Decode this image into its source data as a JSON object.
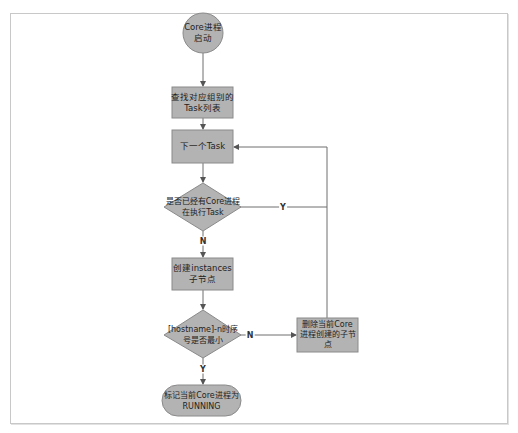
{
  "diagram": {
    "type": "flowchart",
    "colors": {
      "node_fill": "#b3b3b3",
      "node_stroke": "#8a8a8a",
      "edge": "#6f6f6f",
      "frame": "#c8c8c8"
    },
    "nodes": {
      "start": {
        "shape": "circle",
        "label": "Core进程\n启动"
      },
      "find_tasks": {
        "shape": "rect",
        "label": "查找对应组别的\nTask列表"
      },
      "next_task": {
        "shape": "rect",
        "label": "下一个Task"
      },
      "check_running": {
        "shape": "diamond",
        "label": "是否已经有Core进程\n在执行Task"
      },
      "create_instances": {
        "shape": "rect",
        "label": "创建instances\n子节点"
      },
      "check_seq": {
        "shape": "diamond",
        "label": "[hostname]-n时序\n号是否最小"
      },
      "delete_node": {
        "shape": "rect",
        "label": "删除当前Core\n进程创建的子节\n点"
      },
      "mark_running": {
        "shape": "terminator",
        "label": "标记当前Core进程为\nRUNNING"
      }
    },
    "edges": [
      {
        "from": "start",
        "to": "find_tasks",
        "label": ""
      },
      {
        "from": "find_tasks",
        "to": "next_task",
        "label": ""
      },
      {
        "from": "next_task",
        "to": "check_running",
        "label": ""
      },
      {
        "from": "check_running",
        "to": "next_task",
        "label": "Y"
      },
      {
        "from": "check_running",
        "to": "create_instances",
        "label": "N"
      },
      {
        "from": "create_instances",
        "to": "check_seq",
        "label": ""
      },
      {
        "from": "check_seq",
        "to": "delete_node",
        "label": "N"
      },
      {
        "from": "delete_node",
        "to": "next_task",
        "label": ""
      },
      {
        "from": "check_seq",
        "to": "mark_running",
        "label": "Y"
      }
    ],
    "edge_labels": {
      "running_yes": "Y",
      "running_no": "N",
      "seq_no": "N",
      "seq_yes": "Y"
    }
  }
}
